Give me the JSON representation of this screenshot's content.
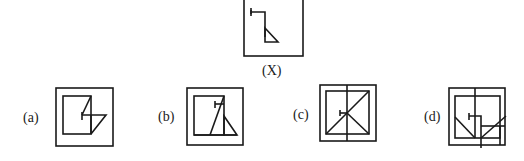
{
  "question_figure": {
    "label": "(X)",
    "description": "Square frame containing a hook-shaped line: a short horizontal stroke with a small vertical tick at left, then a vertical line down ending in a right triangle"
  },
  "options": [
    {
      "label": "(a)",
      "description": "Outer square with inner rectangle and a folded Z-like figure containing the embedded hook shape"
    },
    {
      "label": "(b)",
      "description": "Outer square with inner rectangle, a diagonal line and a triangle containing the embedded hook shape"
    },
    {
      "label": "(c)",
      "description": "Outer square with inner square, a vertical center line and two diagonals crossing, hook tick at center"
    },
    {
      "label": "(d)",
      "description": "Outer square with inner square, a vertical line, diagonals and small rectangles with a hook at center"
    }
  ],
  "colors": {
    "stroke": "#1a1a1a",
    "background": "#ffffff"
  }
}
